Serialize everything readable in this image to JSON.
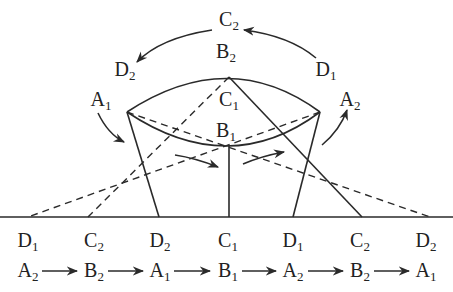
{
  "diagram": {
    "colors": {
      "stroke": "#2a2a2a",
      "text": "#222222",
      "background": "#ffffff"
    },
    "top_labels": [
      {
        "id": "C2-top",
        "letter": "C",
        "sub": "2",
        "x": 229,
        "y": 20
      },
      {
        "id": "B2-top",
        "letter": "B",
        "sub": "2",
        "x": 226,
        "y": 52
      },
      {
        "id": "D2-left",
        "letter": "D",
        "sub": "2",
        "x": 125,
        "y": 70
      },
      {
        "id": "D1-right",
        "letter": "D",
        "sub": "1",
        "x": 326,
        "y": 70
      },
      {
        "id": "A1",
        "letter": "A",
        "sub": "1",
        "x": 101,
        "y": 100
      },
      {
        "id": "A2",
        "letter": "A",
        "sub": "2",
        "x": 350,
        "y": 100
      },
      {
        "id": "C1-mid",
        "letter": "C",
        "sub": "1",
        "x": 229,
        "y": 100
      },
      {
        "id": "B1-mid",
        "letter": "B",
        "sub": "1",
        "x": 226,
        "y": 131
      }
    ],
    "ground_labels": [
      {
        "letter": "D",
        "sub": "1",
        "x": 28
      },
      {
        "letter": "C",
        "sub": "2",
        "x": 94
      },
      {
        "letter": "D",
        "sub": "2",
        "x": 160
      },
      {
        "letter": "C",
        "sub": "1",
        "x": 228
      },
      {
        "letter": "D",
        "sub": "1",
        "x": 293
      },
      {
        "letter": "C",
        "sub": "2",
        "x": 360
      },
      {
        "letter": "D",
        "sub": "2",
        "x": 426
      }
    ],
    "sequence": [
      {
        "letter": "A",
        "sub": "2",
        "x": 28
      },
      {
        "letter": "B",
        "sub": "2",
        "x": 94
      },
      {
        "letter": "A",
        "sub": "1",
        "x": 160
      },
      {
        "letter": "B",
        "sub": "1",
        "x": 228
      },
      {
        "letter": "A",
        "sub": "2",
        "x": 293
      },
      {
        "letter": "B",
        "sub": "2",
        "x": 360
      },
      {
        "letter": "A",
        "sub": "1",
        "x": 426
      }
    ],
    "ground_y": 217,
    "ground_label_y": 241,
    "sequence_y": 271
  }
}
